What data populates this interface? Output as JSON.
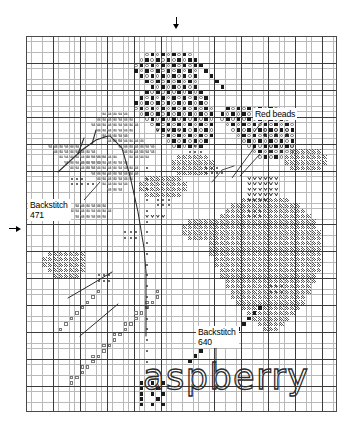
{
  "document": {
    "kind": "cross-stitch-pattern-chart",
    "title_word": "aspberry"
  },
  "grid": {
    "columns": 58,
    "rows": 70,
    "cell_px": 5.385,
    "major_every": 5,
    "minor_line_color": "#b9b9b9",
    "major_line_color": "#3b3b3b",
    "border_color": "#4a4a4a",
    "background_color": "#ffffff"
  },
  "labels": {
    "backstitch_471": {
      "line1": "Backstitch",
      "line2": "471"
    },
    "backstitch_640": {
      "line1": "Backstitch",
      "line2": "640"
    },
    "red_beads": {
      "text": "Red beads"
    }
  },
  "markers": {
    "top_center_arrow": {
      "name": "center-arrow-top",
      "direction": "down",
      "x_px": 176,
      "y_px": 30
    },
    "left_center_arrow": {
      "name": "center-arrow-left",
      "direction": "right",
      "x_px": 19,
      "y_px": 228
    }
  },
  "legend_symbols": [
    {
      "key": "solid",
      "name": "solid-square-stitch",
      "description": "filled dark square"
    },
    {
      "key": "ring",
      "name": "open-circle-stitch",
      "description": "open ring"
    },
    {
      "key": "square",
      "name": "open-square-stitch",
      "description": "small open square"
    },
    {
      "key": "heart",
      "name": "heart-stitch",
      "description": "heart / V glyph"
    },
    {
      "key": "fan",
      "name": "fan-leaf-stitch",
      "description": "repeating W / triangle fan"
    },
    {
      "key": "dense",
      "name": "dense-hatch-stitch",
      "description": "diagonal hatch fill"
    },
    {
      "key": "dot",
      "name": "dot-stitch",
      "description": "small centered dot"
    },
    {
      "key": "bead",
      "name": "red-bead-symbol",
      "description": "ring with centre dot"
    }
  ],
  "colors": {
    "ink": "#000000",
    "stitch_dark": "#1a1a1a",
    "stitch_mid": "#5a5a5a",
    "stitch_light": "#8d8d8d",
    "paper": "#ffffff"
  },
  "chart_data": {
    "type": "heatmap",
    "title": "aspberry",
    "xlabel": "",
    "ylabel": "",
    "grid": true,
    "legend_position": "none",
    "axis_note": "cross-stitch chart: x = stitch column 1..58, y = stitch row 1..70",
    "xlim": [
      1,
      58
    ],
    "ylim": [
      1,
      70
    ],
    "symbol_counts": {
      "solid": 236,
      "ring": 214,
      "dense": 352,
      "fan": 118,
      "heart": 34,
      "square": 36,
      "dot": 46,
      "bead": 12
    },
    "motif_regions": [
      {
        "name": "upper-left-berry-cluster",
        "symbol": "solid+ring",
        "col_range": [
          19,
          36
        ],
        "row_range": [
          3,
          24
        ]
      },
      {
        "name": "upper-right-berry-cluster",
        "symbol": "solid+ring",
        "col_range": [
          36,
          52
        ],
        "row_range": [
          13,
          24
        ]
      },
      {
        "name": "left-leaf-spray",
        "symbol": "fan",
        "col_range": [
          4,
          22
        ],
        "row_range": [
          14,
          36
        ]
      },
      {
        "name": "heart-block",
        "symbol": "heart",
        "col_range": [
          41,
          47
        ],
        "row_range": [
          26,
          31
        ]
      },
      {
        "name": "main-berry-body",
        "symbol": "dense",
        "col_range": [
          36,
          56
        ],
        "row_range": [
          30,
          66
        ]
      },
      {
        "name": "lower-left-stem",
        "symbol": "square",
        "col_range": [
          8,
          24
        ],
        "row_range": [
          48,
          64
        ]
      },
      {
        "name": "bead-accents",
        "symbol": "bead",
        "col_range": [
          44,
          52
        ],
        "row_range": [
          17,
          21
        ]
      }
    ],
    "backstitch_paths": [
      {
        "name": "leaf-vein-471",
        "dmc": "471",
        "points_px": [
          [
            74,
            152
          ],
          [
            96,
            130
          ],
          [
            110,
            118
          ],
          [
            122,
            112
          ]
        ]
      },
      {
        "name": "stem-471",
        "dmc": "471",
        "points_px": [
          [
            118,
            120
          ],
          [
            132,
            150
          ],
          [
            140,
            188
          ],
          [
            146,
            228
          ]
        ]
      },
      {
        "name": "lettering-640",
        "dmc": "640",
        "points_px": [
          [
            214,
            350
          ],
          [
            214,
            366
          ]
        ]
      }
    ]
  }
}
